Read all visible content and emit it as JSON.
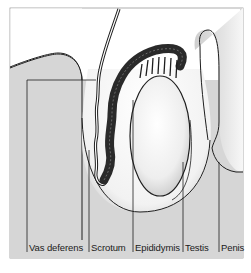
{
  "figure": {
    "type": "anatomical diagram",
    "colors": {
      "background": "#ffffff",
      "body_fill": "#d6d6d6",
      "outline": "#1e1e1e",
      "testis_fill": "#f4f4f4",
      "epididymis": "#2a2a2a"
    }
  },
  "labels": [
    {
      "id": "vas-deferens",
      "text": "Vas deferens"
    },
    {
      "id": "scrotum",
      "text": "Scrotum"
    },
    {
      "id": "epididymis",
      "text": "Epididymis"
    },
    {
      "id": "testis",
      "text": "Testis"
    },
    {
      "id": "penis",
      "text": "Penis"
    }
  ]
}
